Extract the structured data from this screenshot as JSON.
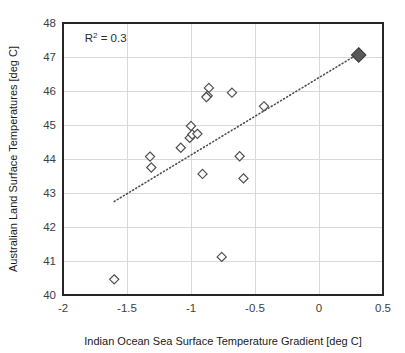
{
  "chart_data": {
    "type": "scatter",
    "title": "",
    "xlabel": "Indian Ocean Sea Surface Temperature Gradient [deg C]",
    "ylabel": "Australian Land Surface Temperatures [deg C]",
    "xlim": [
      -2,
      0.5
    ],
    "ylim": [
      40,
      48
    ],
    "xticks": [
      -2,
      -1.5,
      -1,
      -0.5,
      0,
      0.5
    ],
    "xtick_labels": [
      "-2",
      "-1.5",
      "-1",
      "-0.5",
      "0",
      "0.5"
    ],
    "yticks": [
      40,
      41,
      42,
      43,
      44,
      45,
      46,
      47,
      48
    ],
    "ytick_labels": [
      "40",
      "41",
      "42",
      "43",
      "44",
      "45",
      "46",
      "47",
      "48"
    ],
    "grid": "horizontal-and-vertical",
    "legend": "none",
    "annotations": [
      {
        "name": "r-squared",
        "text_prefix": "R",
        "text_superscript": "2",
        "text_suffix": " = 0.3",
        "full_text": "R2 = 0.3",
        "x": -1.83,
        "y": 47.55
      }
    ],
    "series": [
      {
        "name": "Annual observations",
        "marker": "open-diamond",
        "marker_color": "#fbfbfb",
        "marker_edge_color": "#4c4c4c",
        "points": [
          {
            "x": -1.6,
            "y": 40.46
          },
          {
            "x": -1.32,
            "y": 44.07
          },
          {
            "x": -1.31,
            "y": 43.75
          },
          {
            "x": -1.08,
            "y": 44.33
          },
          {
            "x": -1.0,
            "y": 44.97
          },
          {
            "x": -1.01,
            "y": 44.62
          },
          {
            "x": -0.99,
            "y": 44.72
          },
          {
            "x": -0.95,
            "y": 44.74
          },
          {
            "x": -0.91,
            "y": 43.56
          },
          {
            "x": -0.86,
            "y": 46.09
          },
          {
            "x": -0.87,
            "y": 45.86
          },
          {
            "x": -0.88,
            "y": 45.82
          },
          {
            "x": -0.76,
            "y": 41.12
          },
          {
            "x": -0.68,
            "y": 45.95
          },
          {
            "x": -0.62,
            "y": 44.08
          },
          {
            "x": -0.59,
            "y": 43.43
          },
          {
            "x": -0.43,
            "y": 45.55
          }
        ]
      },
      {
        "name": "Highlighted year",
        "marker": "filled-diamond",
        "marker_color": "#595959",
        "marker_edge_color": "#3d3d3d",
        "points": [
          {
            "x": 0.31,
            "y": 47.06
          }
        ]
      }
    ],
    "trendline": {
      "name": "linear-fit",
      "style": "dotted",
      "color": "#4d4d4d",
      "x_start": -1.6,
      "y_start": 42.75,
      "x_end": 0.31,
      "y_end": 47.1,
      "r_squared": 0.3
    }
  }
}
